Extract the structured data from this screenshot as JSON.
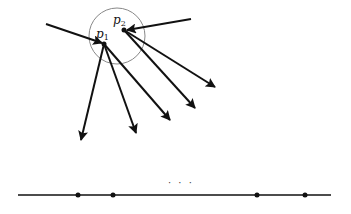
{
  "diagram": {
    "points": [
      {
        "id": "p1",
        "label": "p",
        "subscript": "1",
        "x": 104,
        "y": 44
      },
      {
        "id": "p2",
        "label": "p",
        "subscript": "2",
        "x": 124,
        "y": 30
      }
    ],
    "circle": {
      "cx": 117,
      "cy": 36,
      "r": 28,
      "color": "#888888"
    },
    "incoming_arrows": [
      {
        "from": [
          46,
          24
        ],
        "to": [
          102,
          43
        ]
      },
      {
        "from": [
          191,
          19
        ],
        "to": [
          127,
          30
        ]
      }
    ],
    "outgoing_arrows": [
      {
        "from": [
          104,
          44
        ],
        "to": [
          81,
          140
        ]
      },
      {
        "from": [
          104,
          44
        ],
        "to": [
          136,
          133
        ]
      },
      {
        "from": [
          104,
          44
        ],
        "to": [
          170,
          120
        ]
      },
      {
        "from": [
          124,
          30
        ],
        "to": [
          195,
          108
        ]
      },
      {
        "from": [
          124,
          30
        ],
        "to": [
          215,
          87
        ]
      }
    ],
    "baseline": {
      "x1": 18,
      "x2": 331,
      "y": 195,
      "dots": [
        78,
        113,
        257,
        305
      ],
      "ellipsis": "· · ·",
      "ellipsis_x": 168,
      "ellipsis_y": 186
    },
    "stroke_color": "#111111"
  }
}
